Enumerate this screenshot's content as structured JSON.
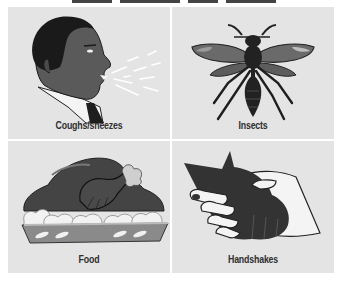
{
  "header": {
    "title_clipped": true
  },
  "panels": [
    {
      "label": "Coughs/sneezes",
      "icon": "coughing-person-icon"
    },
    {
      "label": "Insects",
      "icon": "wasp-icon"
    },
    {
      "label": "Food",
      "icon": "roast-turkey-icon"
    },
    {
      "label": "Handshakes",
      "icon": "handshake-icon"
    }
  ],
  "colors": {
    "panel_bg": "#e4e4e4",
    "dark_fill": "#3a3a3a",
    "skin": "#5a5a5a",
    "hair": "#1a1a1a",
    "label_text": "#2f2f2f"
  }
}
